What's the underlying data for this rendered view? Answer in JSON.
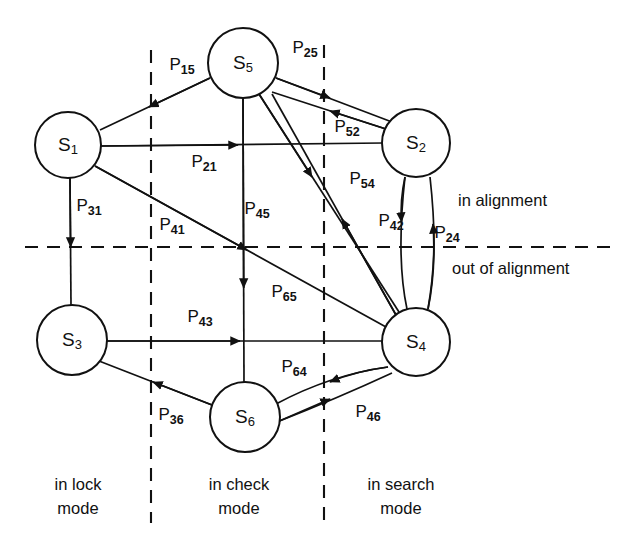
{
  "diagram": {
    "type": "state-transition-diagram",
    "colors": {
      "ink": "#111111",
      "background": "#ffffff"
    },
    "nodes": [
      {
        "id": "S1",
        "letter": "S",
        "subscript": "1",
        "cx": 68,
        "cy": 145,
        "r": 33
      },
      {
        "id": "S2",
        "letter": "S",
        "subscript": "2",
        "cx": 416,
        "cy": 143,
        "r": 34
      },
      {
        "id": "S3",
        "letter": "S",
        "subscript": "3",
        "cx": 72,
        "cy": 340,
        "r": 35
      },
      {
        "id": "S4",
        "letter": "S",
        "subscript": "4",
        "cx": 416,
        "cy": 342,
        "r": 34
      },
      {
        "id": "S5",
        "letter": "S",
        "subscript": "5",
        "cx": 243,
        "cy": 63,
        "r": 35
      },
      {
        "id": "S6",
        "letter": "S",
        "subscript": "6",
        "cx": 245,
        "cy": 417,
        "r": 35
      }
    ],
    "edges": [
      {
        "id": "P15",
        "letter": "P",
        "subscript": "15",
        "from": "S5",
        "to": "S1",
        "label_x": 182,
        "label_y": 66
      },
      {
        "id": "P21",
        "letter": "P",
        "subscript": "21",
        "from": "S1",
        "to": "S2",
        "label_x": 204,
        "label_y": 163
      },
      {
        "id": "P25",
        "letter": "P",
        "subscript": "25",
        "from": "S5",
        "to": "S2",
        "label_x": 305,
        "label_y": 49
      },
      {
        "id": "P52",
        "letter": "P",
        "subscript": "52",
        "from": "S2",
        "to": "S5",
        "label_x": 347,
        "label_y": 128
      },
      {
        "id": "P31",
        "letter": "P",
        "subscript": "31",
        "from": "S1",
        "to": "S3",
        "label_x": 89,
        "label_y": 207
      },
      {
        "id": "P41",
        "letter": "P",
        "subscript": "41",
        "from": "S1",
        "to": "S4",
        "label_x": 172,
        "label_y": 226
      },
      {
        "id": "P45",
        "letter": "P",
        "subscript": "45",
        "from": "S5",
        "to": "S4",
        "label_x": 257,
        "label_y": 210
      },
      {
        "id": "P54",
        "letter": "P",
        "subscript": "54",
        "from": "S4",
        "to": "S5",
        "label_x": 362,
        "label_y": 180
      },
      {
        "id": "P42",
        "letter": "P",
        "subscript": "42",
        "from": "S2",
        "to": "S4",
        "label_x": 391,
        "label_y": 222
      },
      {
        "id": "P24",
        "letter": "P",
        "subscript": "24",
        "from": "S4",
        "to": "S2",
        "label_x": 447,
        "label_y": 234
      },
      {
        "id": "P43",
        "letter": "P",
        "subscript": "43",
        "from": "S3",
        "to": "S4",
        "label_x": 200,
        "label_y": 318
      },
      {
        "id": "P65",
        "letter": "P",
        "subscript": "65",
        "from": "S5",
        "to": "S6",
        "label_x": 284,
        "label_y": 293
      },
      {
        "id": "P64",
        "letter": "P",
        "subscript": "64",
        "from": "S4",
        "to": "S6",
        "label_x": 294,
        "label_y": 368
      },
      {
        "id": "P36",
        "letter": "P",
        "subscript": "36",
        "from": "S6",
        "to": "S3",
        "label_x": 171,
        "label_y": 416
      },
      {
        "id": "P46",
        "letter": "P",
        "subscript": "46",
        "from": "S6",
        "to": "S4",
        "label_x": 368,
        "label_y": 413
      }
    ],
    "dividers": {
      "horizontal": {
        "y": 247,
        "x1": 25,
        "x2": 614
      },
      "vertical_left": {
        "x": 151,
        "y1": 50,
        "y2": 523
      },
      "vertical_right": {
        "x": 324,
        "y1": 45,
        "y2": 523
      }
    },
    "alignment_labels": [
      {
        "id": "in-alignment",
        "text": "in alignment",
        "x": 458,
        "y": 202
      },
      {
        "id": "out-of-alignment",
        "text": "out of alignment",
        "x": 452,
        "y": 270
      }
    ],
    "mode_labels": [
      {
        "id": "lock-mode",
        "line1": "in lock",
        "line2": "mode",
        "x": 78,
        "y1": 486,
        "y2": 510
      },
      {
        "id": "check-mode",
        "line1": "in check",
        "line2": "mode",
        "x": 239,
        "y1": 486,
        "y2": 510
      },
      {
        "id": "search-mode",
        "line1": "in search",
        "line2": "mode",
        "x": 401,
        "y1": 486,
        "y2": 510
      }
    ]
  }
}
